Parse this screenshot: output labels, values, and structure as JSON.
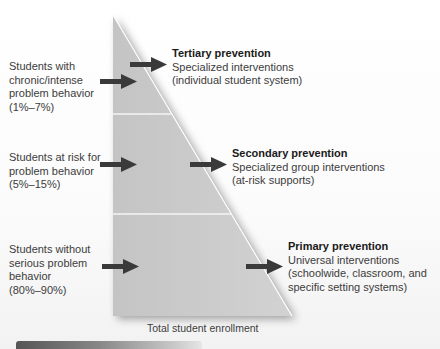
{
  "diagram": {
    "type": "three-tier-prevention-triangle",
    "colors": {
      "triangle_fill": "#c9c9c9",
      "triangle_edge": "#ffffff",
      "divider": "#f4f4f4",
      "arrow": "#3a3a3a",
      "bottom_bar_start": "#555555",
      "bottom_bar_end": "#e6e6e6"
    },
    "tiers": [
      {
        "level": "tertiary",
        "population_label": "Students with\nchronic/intense\nproblem behavior\n(1%–7%)",
        "title": "Tertiary prevention",
        "description_lines": [
          "Specialized interventions",
          "(individual student system)"
        ]
      },
      {
        "level": "secondary",
        "population_label": "Students at risk for\nproblem behavior\n(5%–15%)",
        "title": "Secondary prevention",
        "description_lines": [
          "Specialized group interventions",
          "(at-risk supports)"
        ]
      },
      {
        "level": "primary",
        "population_label": "Students without\nserious problem\nbehavior\n(80%–90%)",
        "title": "Primary prevention",
        "description_lines": [
          "Universal interventions",
          "(schoolwide, classroom, and",
          "specific setting systems)"
        ]
      }
    ],
    "caption": "Total student enrollment"
  }
}
